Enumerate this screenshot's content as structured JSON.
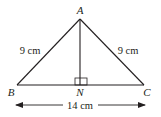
{
  "diagram": {
    "type": "isosceles-triangle",
    "vertices": {
      "A": {
        "label": "A"
      },
      "B": {
        "label": "B"
      },
      "C": {
        "label": "C"
      },
      "N": {
        "label": "N"
      }
    },
    "sides": {
      "AB": "9 cm",
      "AC": "9 cm",
      "BC": "14 cm"
    },
    "right_angle_at": "N",
    "line_color": "#231f20"
  }
}
